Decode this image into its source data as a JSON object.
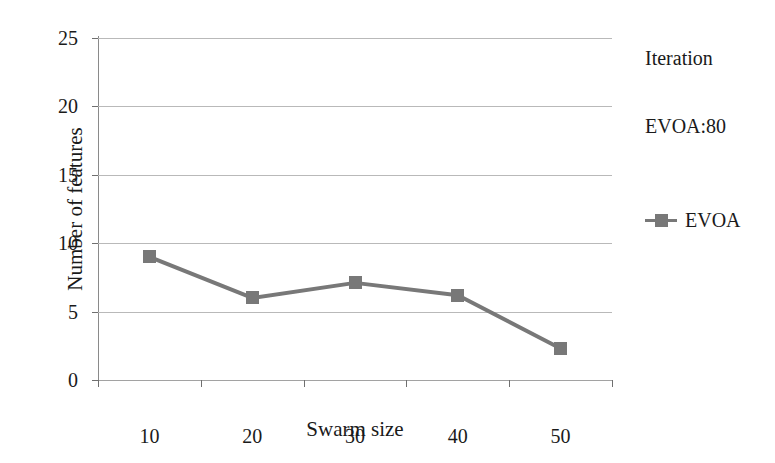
{
  "chart_data": {
    "type": "line",
    "title": "",
    "xlabel": "Swarm size",
    "ylabel": "Number of features",
    "categories": [
      "10",
      "20",
      "30",
      "40",
      "50"
    ],
    "series": [
      {
        "name": "EVOA",
        "values": [
          9.0,
          6.0,
          7.1,
          6.2,
          2.3
        ],
        "color": "#787878",
        "marker": "square"
      }
    ],
    "ylim": [
      0,
      25
    ],
    "yticks": [
      "0",
      "5",
      "10",
      "15",
      "20",
      "25"
    ],
    "grid": true,
    "legend_position": "right"
  },
  "legend": {
    "title": "Iteration",
    "subtitle": "EVOA:80",
    "entries": [
      {
        "label": "EVOA"
      }
    ]
  },
  "colors": {
    "series": "#787878",
    "gridline": "#b9b9b9",
    "axis": "#8a8a8a",
    "text": "#1a1a1a",
    "background": "#ffffff"
  }
}
